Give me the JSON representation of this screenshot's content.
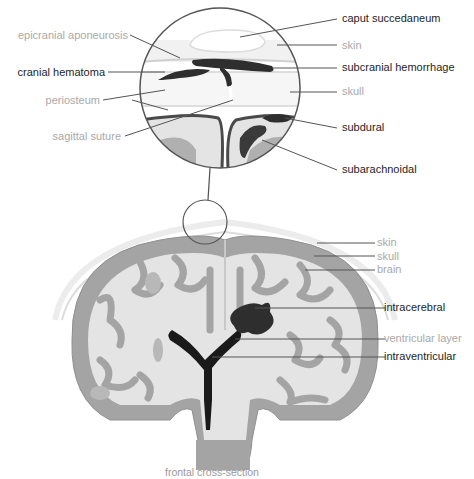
{
  "figure": {
    "caption": "frontal cross-section",
    "colors": {
      "line": "#555555",
      "bleed": "#2e2e2e",
      "brain_light": "#e4e4e4",
      "brain_gray": "#a4a4a4",
      "label_dark": "#1e1e1e",
      "label_light": "#a9a9a9"
    }
  },
  "magnified_view": {
    "labels_left": [
      {
        "text": "epicranial aponeurosis",
        "style": "light"
      },
      {
        "text": "cranial hematoma",
        "style": "dark"
      },
      {
        "text": "periosteum",
        "style": "light"
      },
      {
        "text": "sagittal suture",
        "style": "light"
      }
    ],
    "labels_right": [
      {
        "text": "caput succedaneum",
        "style": "dark"
      },
      {
        "text": "skin",
        "style": "light"
      },
      {
        "text": "subcranial hemorrhage",
        "style": "dark"
      },
      {
        "text": "skull",
        "style": "light"
      },
      {
        "text": "subdural",
        "style": "dark"
      },
      {
        "text": "subarachnoidal",
        "style": "dark"
      }
    ]
  },
  "cross_section": {
    "labels_right": [
      {
        "text": "skin",
        "style": "light"
      },
      {
        "text": "skull",
        "style": "light"
      },
      {
        "text": "brain",
        "style": "light"
      },
      {
        "text": "intracerebral",
        "style": "dark"
      },
      {
        "text": "ventricular layer",
        "style": "light"
      },
      {
        "text": "intraventricular",
        "style": "dark"
      }
    ]
  }
}
